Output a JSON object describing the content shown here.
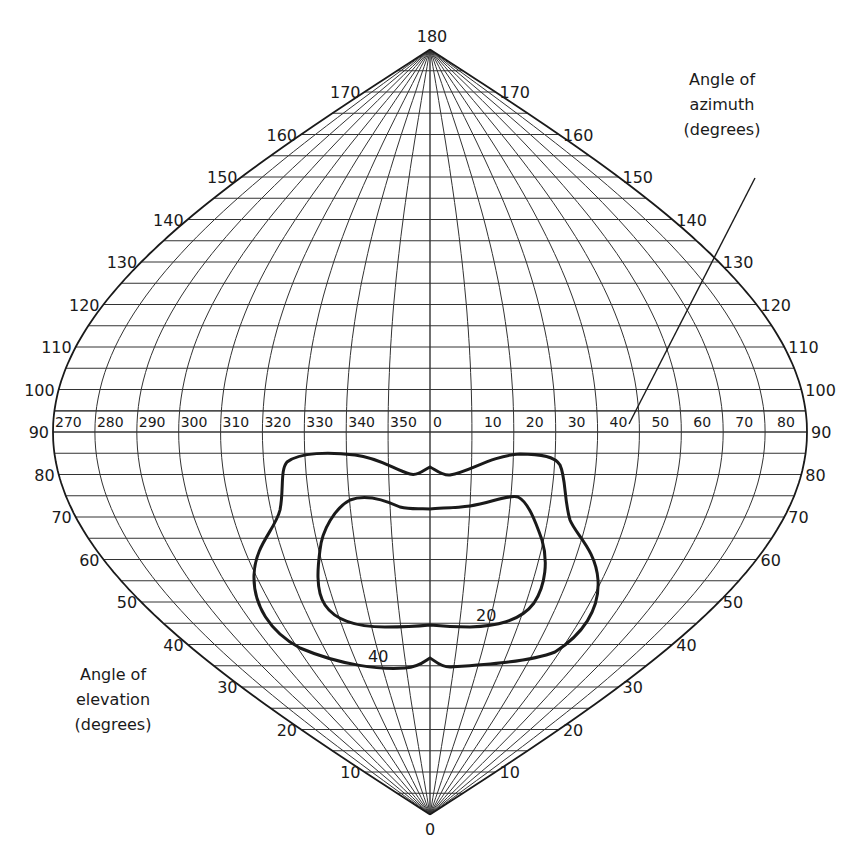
{
  "diagram": {
    "colors": {
      "grid": "#333333",
      "outline": "#1a1a1a",
      "contour": "#1a1a1a",
      "background": "#ffffff"
    },
    "geometry": {
      "center_x": 430,
      "y_at_90": 432,
      "px_per_degree": 4.25,
      "half_width_at_90": 377
    },
    "elevation_axis": {
      "caption_lines": [
        "Angle of",
        "elevation",
        "(degrees)"
      ],
      "grid_step_degrees": 5,
      "label_step_degrees": 10,
      "labels": [
        "0",
        "10",
        "20",
        "30",
        "40",
        "50",
        "60",
        "70",
        "80",
        "90",
        "100",
        "110",
        "120",
        "130",
        "140",
        "150",
        "160",
        "170",
        "180"
      ]
    },
    "azimuth_axis": {
      "caption_lines": [
        "Angle of",
        "azimuth",
        "(degrees)"
      ],
      "grid_step_degrees": 10,
      "labels_left": [
        "270",
        "280",
        "290",
        "300",
        "310",
        "320",
        "330",
        "340",
        "350"
      ],
      "labels_right": [
        "0",
        "10",
        "20",
        "30",
        "40",
        "50",
        "60",
        "70",
        "80"
      ],
      "leader_line": {
        "x1": 755,
        "y1": 178,
        "x2": 629,
        "y2": 424
      }
    },
    "contours": [
      {
        "label": "40",
        "label_pos": [
          368,
          662
        ]
      },
      {
        "label": "20",
        "label_pos": [
          476,
          621
        ]
      }
    ]
  },
  "chart_data": {
    "type": "contour",
    "title": "",
    "xlabel": "Angle of azimuth (degrees)",
    "ylabel": "Angle of elevation (degrees)",
    "x_ticks": [
      270,
      280,
      290,
      300,
      310,
      320,
      330,
      340,
      350,
      0,
      10,
      20,
      30,
      40,
      50,
      60,
      70,
      80
    ],
    "y_ticks": [
      0,
      10,
      20,
      30,
      40,
      50,
      60,
      70,
      80,
      90,
      100,
      110,
      120,
      130,
      140,
      150,
      160,
      170,
      180
    ],
    "ylim": [
      0,
      180
    ],
    "grid": true,
    "series": [
      {
        "name": "40",
        "approx_extent": {
          "azimuth_left": 312,
          "azimuth_right": 42,
          "elevation_top": 85,
          "elevation_bottom": 40
        }
      },
      {
        "name": "20",
        "approx_extent": {
          "azimuth_left": 322,
          "azimuth_right": 32,
          "elevation_top": 78,
          "elevation_bottom": 50
        }
      }
    ]
  }
}
